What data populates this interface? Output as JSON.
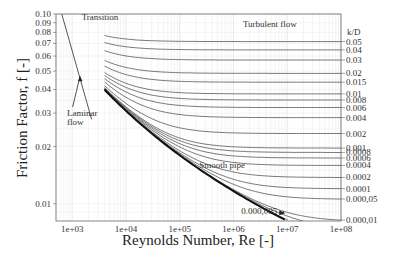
{
  "chart_data": {
    "type": "line",
    "xlabel": "Reynolds Number, Re [-]",
    "ylabel": "Friction Factor, f [-]",
    "xscale": "log",
    "yscale": "log",
    "xlim": [
      500,
      100000000
    ],
    "ylim": [
      0.0081,
      0.1
    ],
    "grid": true,
    "x_ticks": [
      {
        "value": 1000,
        "label": "1e+03"
      },
      {
        "value": 10000,
        "label": "1e+04"
      },
      {
        "value": 100000,
        "label": "1e+05"
      },
      {
        "value": 1000000,
        "label": "1e+06"
      },
      {
        "value": 10000000,
        "label": "1e+07"
      },
      {
        "value": 100000000,
        "label": "1e+08"
      }
    ],
    "y_ticks": [
      {
        "value": 0.1,
        "label": "0.10"
      },
      {
        "value": 0.09,
        "label": "0.09"
      },
      {
        "value": 0.08,
        "label": "0.08"
      },
      {
        "value": 0.07,
        "label": "0.07"
      },
      {
        "value": 0.06,
        "label": "0.06"
      },
      {
        "value": 0.05,
        "label": "0.05"
      },
      {
        "value": 0.04,
        "label": "0.04"
      },
      {
        "value": 0.03,
        "label": "0.03"
      },
      {
        "value": 0.02,
        "label": "0.02"
      },
      {
        "value": 0.01,
        "label": "0.01"
      }
    ],
    "right_axis_title": "k/D",
    "relative_roughness": [
      {
        "value": 0.05,
        "label": "0.05"
      },
      {
        "value": 0.04,
        "label": "0.04"
      },
      {
        "value": 0.03,
        "label": "0.03"
      },
      {
        "value": 0.02,
        "label": "0.02"
      },
      {
        "value": 0.015,
        "label": "0.015"
      },
      {
        "value": 0.01,
        "label": "0.01"
      },
      {
        "value": 0.008,
        "label": "0.008"
      },
      {
        "value": 0.006,
        "label": "0.006"
      },
      {
        "value": 0.004,
        "label": "0.004"
      },
      {
        "value": 0.002,
        "label": "0.002"
      },
      {
        "value": 0.001,
        "label": "0.001"
      },
      {
        "value": 0.0008,
        "label": "0.0008"
      },
      {
        "value": 0.0006,
        "label": "0.0006"
      },
      {
        "value": 0.0004,
        "label": "0.0004"
      },
      {
        "value": 0.0002,
        "label": "0.0002"
      },
      {
        "value": 0.0001,
        "label": "0.0001"
      },
      {
        "value": 5e-05,
        "label": "0.000,05"
      },
      {
        "value": 1e-05,
        "label": "0.000,01"
      },
      {
        "value": 5e-06,
        "label": ""
      },
      {
        "value": 1e-06,
        "label": ""
      },
      {
        "value": 0,
        "label": ""
      }
    ],
    "series": [
      {
        "name": "Laminar flow",
        "equation": "f = 64/Re",
        "x_range": [
          640,
          2300
        ]
      },
      {
        "name": "Turbulent (Colebrook)",
        "equation": "1/sqrt(f) = -2 log10(k/D/3.7 + 2.51/(Re sqrt(f)))",
        "x_range": [
          4000,
          100000000
        ]
      },
      {
        "name": "Smooth pipe",
        "k_over_D": 0
      }
    ],
    "annotations": [
      {
        "text": "Transition",
        "x": 1500,
        "y": 0.093
      },
      {
        "text": "Turbulent flow",
        "x": 1500000,
        "y": 0.085
      },
      {
        "text": "Laminar",
        "x": 800,
        "y": 0.029
      },
      {
        "text": "flow",
        "x": 800,
        "y": 0.026
      },
      {
        "text": "Smooth pipe",
        "x": 230000,
        "y": 0.0155
      },
      {
        "text": "0.000,005",
        "x": 1400000,
        "y": 0.0088
      }
    ]
  }
}
